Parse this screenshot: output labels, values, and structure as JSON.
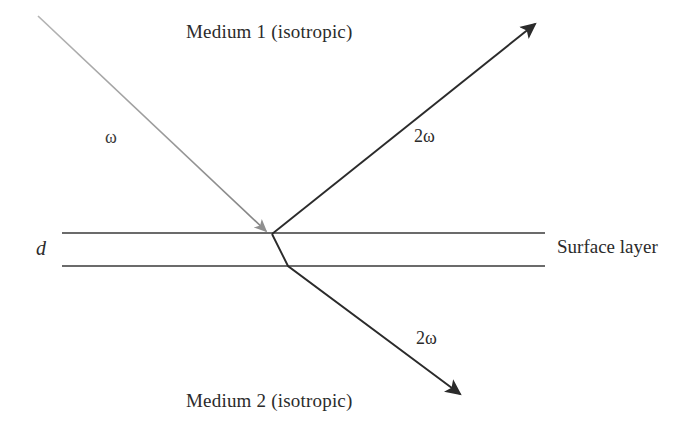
{
  "figure": {
    "width": 696,
    "height": 442,
    "background": "#ffffff",
    "ray_color": "#2b2b2b",
    "incident_ray_color": "#8a8a8a",
    "interface_color": "#3a3a3a"
  },
  "labels": {
    "medium1": "Medium 1 (isotropic)",
    "medium2": "Medium 2 (isotropic)",
    "surface_layer": "Surface layer",
    "thickness": "d",
    "incident_frequency": "ω",
    "reflected_harmonic": "2ω",
    "transmitted_harmonic": "2ω"
  },
  "geometry": {
    "interfaces": [
      {
        "name": "top-interface",
        "x1": 62,
        "y1": 233,
        "x2": 545,
        "y2": 233
      },
      {
        "name": "bottom-interface",
        "x1": 62,
        "y1": 266,
        "x2": 545,
        "y2": 266
      }
    ],
    "incident_ray": {
      "x1": 38,
      "y1": 16,
      "x2": 268,
      "y2": 233
    },
    "reflected_ray": {
      "x1": 272,
      "y1": 234,
      "x2": 537,
      "y2": 22
    },
    "transmitted_ray_in_layer": {
      "x1": 272,
      "y1": 234,
      "x2": 288,
      "y2": 266
    },
    "transmitted_ray_medium2": {
      "x1": 288,
      "y1": 266,
      "x2": 462,
      "y2": 396
    },
    "incidence_point": {
      "x": 272,
      "y": 234
    }
  }
}
